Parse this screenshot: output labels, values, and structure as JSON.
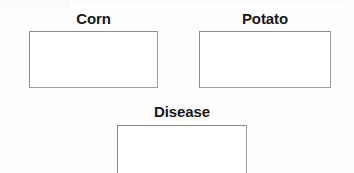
{
  "page": {
    "background_color": "#ffffff",
    "line_color": "#8e9094",
    "label_color": "#17181a"
  },
  "diagram": {
    "type": "concept-boxes",
    "nodes": [
      {
        "id": "corn",
        "label": "Corn",
        "box": {
          "x": 29,
          "y": 31,
          "width": 129,
          "height": 57
        },
        "content": "",
        "cropped": false
      },
      {
        "id": "potato",
        "label": "Potato",
        "box": {
          "x": 199,
          "y": 31,
          "width": 132,
          "height": 57
        },
        "content": "",
        "cropped": false
      },
      {
        "id": "disease",
        "label": "Disease",
        "box": {
          "x": 117,
          "y": 125,
          "width": 130,
          "height": 60
        },
        "content": "",
        "cropped": true
      }
    ]
  }
}
